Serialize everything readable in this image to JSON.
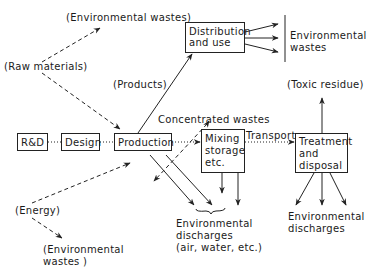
{
  "diagram": {
    "nodes": {
      "rd": "R&D",
      "design": "Design",
      "production": "Production",
      "distribution": [
        "Distribution",
        "and use"
      ],
      "mixing": [
        "Mixing",
        "storage",
        "etc."
      ],
      "treatment": [
        "Treatment",
        "and",
        "disposal"
      ]
    },
    "labels": {
      "env_wastes_top": "(Environmental wastes)",
      "raw_materials": "(Raw materials)",
      "products": "(Products)",
      "concentrated_wastes": "Concentrated wastes",
      "env_wastes_right": [
        "Environmental",
        "wastes"
      ],
      "toxic_residue": "(Toxic residue)",
      "transport": "Transport",
      "energy": "(Energy)",
      "env_wastes_bottom": [
        "(Environmental",
        "wastes )"
      ],
      "env_discharges_center": [
        "Environmental",
        "discharges",
        "(air, water, etc.)"
      ],
      "env_discharges_right": [
        "Environmental",
        "discharges"
      ]
    },
    "edges": [
      {
        "from": "rd",
        "to": "design",
        "style": "dotted"
      },
      {
        "from": "design",
        "to": "production",
        "style": "dotted"
      },
      {
        "from": "production",
        "to": "mixing",
        "style": "dotted"
      },
      {
        "from": "mixing",
        "to": "treatment",
        "style": "dotted",
        "label": "Transport"
      },
      {
        "from": "production",
        "to": "distribution",
        "style": "solid",
        "label": "(Products)"
      },
      {
        "from": "distribution",
        "to": "env_wastes_right",
        "style": "solid",
        "count": 3
      },
      {
        "from": "raw_materials",
        "to": "env_wastes_top",
        "style": "dashed"
      },
      {
        "from": "raw_materials",
        "to": "production",
        "style": "dashed"
      },
      {
        "from": "energy",
        "to": "production",
        "style": "dashed"
      },
      {
        "from": "energy",
        "to": "env_wastes_bottom",
        "style": "dashed"
      },
      {
        "from": "mixing",
        "to": "production",
        "style": "dashed",
        "label": "Concentrated wastes"
      },
      {
        "from": "production",
        "to": "env_discharges_center",
        "style": "solid",
        "count": 2
      },
      {
        "from": "mixing",
        "to": "env_discharges_center",
        "style": "solid",
        "count": 2
      },
      {
        "from": "treatment",
        "to": "toxic_residue",
        "style": "solid"
      },
      {
        "from": "treatment",
        "to": "env_discharges_right",
        "style": "solid",
        "count": 3
      }
    ]
  }
}
